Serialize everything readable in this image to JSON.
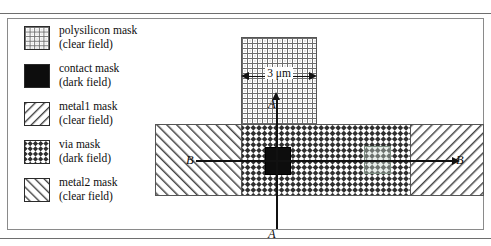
{
  "legend": {
    "items": [
      {
        "pattern": "polysilicon",
        "name": "polysilicon mask",
        "field": "(clear field)"
      },
      {
        "pattern": "contact",
        "name": "contact mask",
        "field": "(dark field)"
      },
      {
        "pattern": "metal1",
        "name": "metal1 mask",
        "field": "(clear field)"
      },
      {
        "pattern": "via",
        "name": "via mask",
        "field": "(dark field)"
      },
      {
        "pattern": "metal2",
        "name": "metal2 mask",
        "field": "(clear field)"
      }
    ]
  },
  "diagram": {
    "dimension_label": "3 μm",
    "section_labels": {
      "a_top": "A",
      "a_bottom": "A",
      "b_left": "B",
      "b_right": "B"
    },
    "regions": [
      {
        "name": "polysilicon-column",
        "pattern": "polysilicon"
      },
      {
        "name": "metal2-band-left",
        "pattern": "metal2"
      },
      {
        "name": "via-band-center",
        "pattern": "via"
      },
      {
        "name": "metal1-band-right",
        "pattern": "metal1"
      },
      {
        "name": "contact-square",
        "pattern": "contact"
      },
      {
        "name": "via-square-right",
        "pattern": "via-overlay"
      }
    ]
  },
  "colors": {
    "ink": "#0d0d0d",
    "hatch": "#3a3a3a",
    "contact_fill": "#0d0d0d",
    "rule": "#6e6e6e"
  }
}
